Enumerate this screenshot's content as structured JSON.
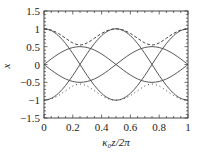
{
  "chart_data": {
    "type": "line",
    "title": "",
    "xlabel": "κ₀z/2π",
    "ylabel": "x",
    "xlim": [
      0,
      1
    ],
    "ylim": [
      -1.5,
      1.5
    ],
    "grid": false,
    "legend": null,
    "x_ticks": [
      "0",
      "0.2",
      "0.4",
      "0.6",
      "0.8",
      "1"
    ],
    "y_ticks": [
      "1.5",
      "1",
      "0.5",
      "0",
      "−0.5",
      "−1",
      "−1.5"
    ],
    "x": [
      0,
      0.05,
      0.1,
      0.15,
      0.2,
      0.25,
      0.3,
      0.35,
      0.4,
      0.45,
      0.5,
      0.55,
      0.6,
      0.65,
      0.7,
      0.75,
      0.8,
      0.85,
      0.9,
      0.95,
      1
    ],
    "series": [
      {
        "name": "solid-1",
        "style": "solid",
        "values": [
          1,
          0.951,
          0.809,
          0.588,
          0.309,
          0,
          -0.309,
          -0.588,
          -0.809,
          -0.951,
          -1,
          -0.951,
          -0.809,
          -0.588,
          -0.309,
          0,
          0.309,
          0.588,
          0.809,
          0.951,
          1
        ]
      },
      {
        "name": "solid-2",
        "style": "solid",
        "values": [
          -1,
          -0.951,
          -0.809,
          -0.588,
          -0.309,
          0,
          0.309,
          0.588,
          0.809,
          0.951,
          1,
          0.951,
          0.809,
          0.588,
          0.309,
          0,
          -0.309,
          -0.588,
          -0.809,
          -0.951,
          -1
        ]
      },
      {
        "name": "solid-3",
        "style": "solid",
        "values": [
          0,
          0.155,
          0.294,
          0.405,
          0.476,
          0.5,
          0.476,
          0.405,
          0.294,
          0.155,
          0,
          -0.155,
          -0.294,
          -0.405,
          -0.476,
          -0.5,
          -0.476,
          -0.405,
          -0.294,
          -0.155,
          0
        ]
      },
      {
        "name": "solid-4",
        "style": "solid",
        "values": [
          0,
          -0.155,
          -0.294,
          -0.405,
          -0.476,
          -0.5,
          -0.476,
          -0.405,
          -0.294,
          -0.155,
          0,
          0.155,
          0.294,
          0.405,
          0.476,
          0.5,
          0.476,
          0.405,
          0.294,
          0.155,
          0
        ]
      },
      {
        "name": "dashed-upper",
        "style": "dashed",
        "values": [
          1,
          0.966,
          0.87,
          0.736,
          0.605,
          0.548,
          0.605,
          0.736,
          0.87,
          0.966,
          1,
          0.966,
          0.87,
          0.736,
          0.605,
          0.548,
          0.605,
          0.736,
          0.87,
          0.966,
          1
        ]
      },
      {
        "name": "dotted-lower",
        "style": "dotted",
        "values": [
          -1,
          -0.966,
          -0.87,
          -0.736,
          -0.605,
          -0.548,
          -0.605,
          -0.736,
          -0.87,
          -0.966,
          -1,
          -0.966,
          -0.87,
          -0.736,
          -0.605,
          -0.548,
          -0.605,
          -0.736,
          -0.87,
          -0.966,
          -1
        ]
      }
    ]
  }
}
